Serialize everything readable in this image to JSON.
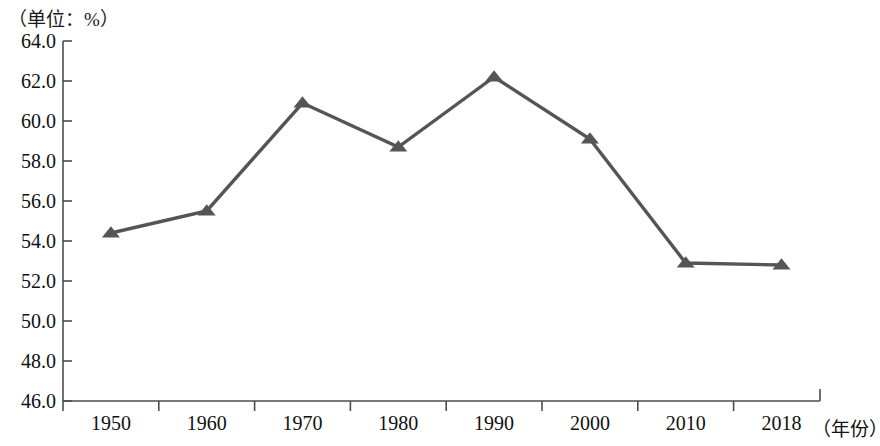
{
  "chart_data": {
    "type": "line",
    "title": "",
    "unit_note": "（单位：%）",
    "xlabel": "（年份）",
    "ylabel": "",
    "categories": [
      "1950",
      "1960",
      "1970",
      "1980",
      "1990",
      "2000",
      "2010",
      "2018"
    ],
    "x": [
      1950,
      1960,
      1970,
      1980,
      1990,
      2000,
      2010,
      2018
    ],
    "values": [
      54.4,
      55.5,
      60.9,
      58.7,
      62.2,
      59.1,
      52.9,
      52.8
    ],
    "series": [
      {
        "name": "",
        "values": [
          54.4,
          55.5,
          60.9,
          58.7,
          62.2,
          59.1,
          52.9,
          52.8
        ]
      }
    ],
    "ylim": [
      46.0,
      64.0
    ],
    "ytick_labels": [
      "64.0",
      "62.0",
      "60.0",
      "58.0",
      "56.0",
      "54.0",
      "52.0",
      "50.0",
      "48.0",
      "46.0"
    ],
    "ytick_values": [
      64.0,
      62.0,
      60.0,
      58.0,
      56.0,
      54.0,
      52.0,
      50.0,
      48.0,
      46.0
    ],
    "ytick_step": 2.0,
    "grid": false,
    "legend": "none",
    "marker": "triangle",
    "line_color": "#555555",
    "marker_color": "#555555",
    "axis_color": "#4d4d4d"
  }
}
